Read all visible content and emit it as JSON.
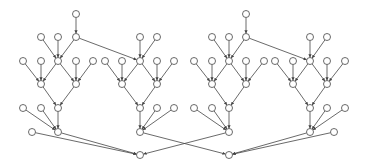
{
  "diagram": {
    "type": "directed-graph",
    "colors": {
      "stroke": "#444444",
      "node_fill": "#ffffff",
      "background": "#ffffff"
    },
    "node_radius": 3.5,
    "nodes": [
      {
        "id": "L0",
        "x": 76,
        "y": 14
      },
      {
        "id": "L1a",
        "x": 41,
        "y": 37
      },
      {
        "id": "L1b",
        "x": 58,
        "y": 37
      },
      {
        "id": "L1c",
        "x": 76,
        "y": 37
      },
      {
        "id": "L1d",
        "x": 140,
        "y": 37
      },
      {
        "id": "L1e",
        "x": 157,
        "y": 37
      },
      {
        "id": "L2a",
        "x": 23,
        "y": 61
      },
      {
        "id": "L2b",
        "x": 41,
        "y": 61
      },
      {
        "id": "L2c",
        "x": 58,
        "y": 61
      },
      {
        "id": "L2d",
        "x": 76,
        "y": 61
      },
      {
        "id": "L2e",
        "x": 93,
        "y": 61
      },
      {
        "id": "L2f",
        "x": 105,
        "y": 61
      },
      {
        "id": "L2g",
        "x": 122,
        "y": 61
      },
      {
        "id": "L2h",
        "x": 140,
        "y": 61
      },
      {
        "id": "L2i",
        "x": 157,
        "y": 61
      },
      {
        "id": "L2j",
        "x": 174,
        "y": 61
      },
      {
        "id": "L3a",
        "x": 41,
        "y": 84
      },
      {
        "id": "L3b",
        "x": 76,
        "y": 84
      },
      {
        "id": "L3c",
        "x": 122,
        "y": 84
      },
      {
        "id": "L3d",
        "x": 157,
        "y": 84
      },
      {
        "id": "L4a",
        "x": 23,
        "y": 108
      },
      {
        "id": "L4b",
        "x": 41,
        "y": 108
      },
      {
        "id": "L4c",
        "x": 58,
        "y": 108
      },
      {
        "id": "L4d",
        "x": 140,
        "y": 108
      },
      {
        "id": "L4e",
        "x": 157,
        "y": 108
      },
      {
        "id": "L4f",
        "x": 174,
        "y": 108
      },
      {
        "id": "L5a",
        "x": 32,
        "y": 132
      },
      {
        "id": "L5b",
        "x": 58,
        "y": 132
      },
      {
        "id": "L5c",
        "x": 140,
        "y": 132
      },
      {
        "id": "SL",
        "x": 140,
        "y": 155
      },
      {
        "id": "R0",
        "x": 246,
        "y": 14
      },
      {
        "id": "R1a",
        "x": 212,
        "y": 37
      },
      {
        "id": "R1b",
        "x": 229,
        "y": 37
      },
      {
        "id": "R1c",
        "x": 246,
        "y": 37
      },
      {
        "id": "R1d",
        "x": 310,
        "y": 37
      },
      {
        "id": "R1e",
        "x": 327,
        "y": 37
      },
      {
        "id": "R2a",
        "x": 194,
        "y": 61
      },
      {
        "id": "R2b",
        "x": 212,
        "y": 61
      },
      {
        "id": "R2c",
        "x": 229,
        "y": 61
      },
      {
        "id": "R2d",
        "x": 246,
        "y": 61
      },
      {
        "id": "R2e",
        "x": 264,
        "y": 61
      },
      {
        "id": "R2f",
        "x": 275,
        "y": 61
      },
      {
        "id": "R2g",
        "x": 293,
        "y": 61
      },
      {
        "id": "R2h",
        "x": 310,
        "y": 61
      },
      {
        "id": "R2i",
        "x": 327,
        "y": 61
      },
      {
        "id": "R2j",
        "x": 345,
        "y": 61
      },
      {
        "id": "R3a",
        "x": 212,
        "y": 84
      },
      {
        "id": "R3b",
        "x": 246,
        "y": 84
      },
      {
        "id": "R3c",
        "x": 293,
        "y": 84
      },
      {
        "id": "R3d",
        "x": 327,
        "y": 84
      },
      {
        "id": "R4a",
        "x": 194,
        "y": 108
      },
      {
        "id": "R4b",
        "x": 212,
        "y": 108
      },
      {
        "id": "R4c",
        "x": 229,
        "y": 108
      },
      {
        "id": "R4d",
        "x": 310,
        "y": 108
      },
      {
        "id": "R4e",
        "x": 327,
        "y": 108
      },
      {
        "id": "R4f",
        "x": 345,
        "y": 108
      },
      {
        "id": "R5a",
        "x": 229,
        "y": 132
      },
      {
        "id": "R5b",
        "x": 310,
        "y": 132
      },
      {
        "id": "R5c",
        "x": 334,
        "y": 132
      },
      {
        "id": "SR",
        "x": 229,
        "y": 155
      }
    ],
    "edges": [
      [
        "L0",
        "L1c"
      ],
      [
        "L1a",
        "L2c"
      ],
      [
        "L1b",
        "L2c"
      ],
      [
        "L1c",
        "L2c"
      ],
      [
        "L1c",
        "L2h"
      ],
      [
        "L1d",
        "L2h"
      ],
      [
        "L1e",
        "L2h"
      ],
      [
        "L2a",
        "L3a"
      ],
      [
        "L2b",
        "L3a"
      ],
      [
        "L2c",
        "L3a"
      ],
      [
        "L2c",
        "L3b"
      ],
      [
        "L2d",
        "L3b"
      ],
      [
        "L2e",
        "L3b"
      ],
      [
        "L2f",
        "L3c"
      ],
      [
        "L2g",
        "L3c"
      ],
      [
        "L2h",
        "L3c"
      ],
      [
        "L2h",
        "L3d"
      ],
      [
        "L2i",
        "L3d"
      ],
      [
        "L2j",
        "L3d"
      ],
      [
        "L3a",
        "L4c"
      ],
      [
        "L3b",
        "L4c"
      ],
      [
        "L3c",
        "L4d"
      ],
      [
        "L3d",
        "L4d"
      ],
      [
        "L4a",
        "L5b"
      ],
      [
        "L4b",
        "L5b"
      ],
      [
        "L4c",
        "L5b"
      ],
      [
        "L4d",
        "L5c"
      ],
      [
        "L4e",
        "L5c"
      ],
      [
        "L4f",
        "L5c"
      ],
      [
        "L5a",
        "SL"
      ],
      [
        "L5b",
        "SL"
      ],
      [
        "L5c",
        "SR"
      ],
      [
        "R0",
        "R1c"
      ],
      [
        "R1a",
        "R2c"
      ],
      [
        "R1b",
        "R2c"
      ],
      [
        "R1c",
        "R2c"
      ],
      [
        "R1c",
        "R2h"
      ],
      [
        "R1d",
        "R2h"
      ],
      [
        "R1e",
        "R2h"
      ],
      [
        "R2a",
        "R3a"
      ],
      [
        "R2b",
        "R3a"
      ],
      [
        "R2c",
        "R3a"
      ],
      [
        "R2c",
        "R3b"
      ],
      [
        "R2d",
        "R3b"
      ],
      [
        "R2e",
        "R3b"
      ],
      [
        "R2f",
        "R3c"
      ],
      [
        "R2g",
        "R3c"
      ],
      [
        "R2h",
        "R3c"
      ],
      [
        "R2h",
        "R3d"
      ],
      [
        "R2i",
        "R3d"
      ],
      [
        "R2j",
        "R3d"
      ],
      [
        "R3a",
        "R4c"
      ],
      [
        "R3b",
        "R4c"
      ],
      [
        "R3c",
        "R4d"
      ],
      [
        "R3d",
        "R4d"
      ],
      [
        "R4a",
        "R5a"
      ],
      [
        "R4b",
        "R5a"
      ],
      [
        "R4c",
        "R5a"
      ],
      [
        "R4d",
        "R5b"
      ],
      [
        "R4e",
        "R5b"
      ],
      [
        "R4f",
        "R5b"
      ],
      [
        "R5a",
        "SL"
      ],
      [
        "R5b",
        "SR"
      ],
      [
        "R5c",
        "SR"
      ]
    ]
  }
}
